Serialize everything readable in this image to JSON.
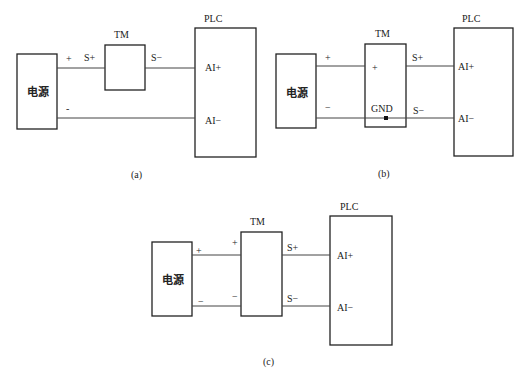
{
  "diagrams": {
    "a": {
      "caption": "(a)",
      "power": "电源",
      "tm": "TM",
      "plc": "PLC",
      "power_plus": "+",
      "power_minus": "-",
      "tm_in": "S+",
      "tm_out": "S−",
      "plc_in_plus": "AI+",
      "plc_in_minus": "AI−"
    },
    "b": {
      "caption": "(b)",
      "power": "电源",
      "tm": "TM",
      "plc": "PLC",
      "power_plus": "+",
      "power_minus": "−",
      "tm_plus": "+",
      "tm_gnd": "GND",
      "s_plus": "S+",
      "s_minus": "S−",
      "plc_in_plus": "AI+",
      "plc_in_minus": "AI−"
    },
    "c": {
      "caption": "(c)",
      "power": "电源",
      "tm": "TM",
      "plc": "PLC",
      "power_plus": "+",
      "power_minus": "−",
      "tm_plus": "+",
      "tm_minus": "−",
      "s_plus": "S+",
      "s_minus": "S−",
      "plc_in_plus": "AI+",
      "plc_in_minus": "AI−"
    }
  }
}
